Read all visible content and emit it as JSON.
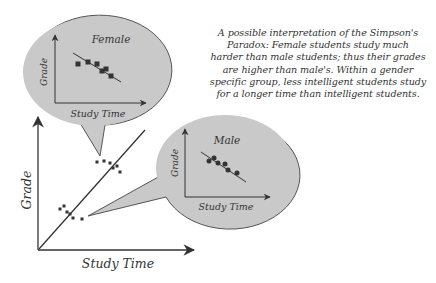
{
  "caption": {
    "lines": [
      "A possible interpretation of the Simpson's",
      "Paradox: Female students study much",
      "harder than male students; thus their grades",
      "are higher than male's. Within a gender",
      "specific group, less intelligent students study",
      "for a longer time than intelligent students."
    ]
  },
  "main_plot": {
    "xlabel": "Study Time",
    "ylabel": "Grade",
    "trend": "positive",
    "upper_cluster": [
      [
        97,
        162
      ],
      [
        104,
        161
      ],
      [
        110,
        163
      ],
      [
        113,
        168
      ],
      [
        117,
        166
      ],
      [
        120,
        172
      ]
    ],
    "lower_cluster": [
      [
        60,
        209
      ],
      [
        64,
        206
      ],
      [
        67,
        212
      ],
      [
        70,
        214
      ],
      [
        73,
        218
      ],
      [
        82,
        219
      ]
    ]
  },
  "female_bubble": {
    "label": "Female",
    "xlabel": "Study Time",
    "ylabel": "Grade",
    "marker": "square",
    "trend": "negative",
    "points": [
      [
        78,
        64
      ],
      [
        88,
        62
      ],
      [
        97,
        64
      ],
      [
        102,
        71
      ],
      [
        106,
        69
      ],
      [
        111,
        76
      ]
    ]
  },
  "male_bubble": {
    "label": "Male",
    "xlabel": "Study Time",
    "ylabel": "Grade",
    "marker": "circle",
    "trend": "negative",
    "points": [
      [
        209,
        161
      ],
      [
        214,
        158
      ],
      [
        218,
        163
      ],
      [
        225,
        164
      ],
      [
        228,
        170
      ],
      [
        237,
        173
      ]
    ]
  },
  "colors": {
    "bubble_fill": "#c9c9c9",
    "bubble_stroke": "#555555",
    "ink": "#333333",
    "background": "#ffffff"
  }
}
